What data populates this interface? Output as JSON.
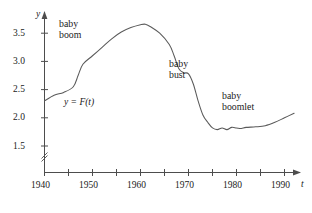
{
  "figure": {
    "background_color": "#ffffff",
    "curve_color": "#5a5a5a",
    "axis_color": "#4d4d4d",
    "text_color": "#1a1a1a"
  },
  "axes": {
    "x_axis_name": "t",
    "y_axis_name": "y",
    "x_tick_labels": [
      "1940",
      "1950",
      "1960",
      "1970",
      "1980",
      "1990"
    ],
    "x_minor_ticks": [
      "1945",
      "1955",
      "1965",
      "1975",
      "1985"
    ],
    "y_tick_labels": [
      "1.5",
      "2.0",
      "2.5",
      "3.0",
      "3.5"
    ],
    "y_axis_break": "axis-break-double-slash"
  },
  "annotations": {
    "baby_boom": {
      "line1": "baby",
      "line2": "boom"
    },
    "baby_bust": {
      "line1": "baby",
      "line2": "bust"
    },
    "baby_boomlet": {
      "line1": "baby",
      "line2": "boomlet"
    },
    "curve_label": "y = F(t)"
  },
  "chart_data": {
    "type": "line",
    "title": "",
    "xlabel": "t",
    "ylabel": "y",
    "xlim": [
      1940,
      1993
    ],
    "ylim": [
      1.28,
      3.78
    ],
    "grid": false,
    "legend": "none",
    "axis_break_y_below": 1.5,
    "x_tick_values": [
      1940,
      1945,
      1950,
      1955,
      1960,
      1965,
      1970,
      1975,
      1980,
      1985,
      1990
    ],
    "x_tick_labeled": [
      1940,
      1950,
      1960,
      1970,
      1980,
      1990
    ],
    "y_tick_values": [
      1.5,
      2.0,
      2.5,
      3.0,
      3.5
    ],
    "series": [
      {
        "name": "y = F(t)",
        "x": [
          1940,
          1942,
          1944,
          1946,
          1947,
          1948,
          1950,
          1952,
          1954,
          1956,
          1958,
          1960,
          1961,
          1962,
          1964,
          1966,
          1967,
          1968,
          1969,
          1970,
          1971,
          1972,
          1973,
          1974,
          1975,
          1976,
          1977,
          1978,
          1979,
          1980,
          1981,
          1982,
          1984,
          1986,
          1988,
          1990,
          1992
        ],
        "y": [
          2.3,
          2.4,
          2.45,
          2.55,
          2.75,
          2.95,
          3.1,
          3.25,
          3.4,
          3.52,
          3.6,
          3.65,
          3.66,
          3.62,
          3.5,
          3.3,
          3.1,
          2.87,
          2.8,
          2.78,
          2.6,
          2.3,
          2.05,
          1.92,
          1.82,
          1.79,
          1.82,
          1.79,
          1.83,
          1.82,
          1.81,
          1.83,
          1.84,
          1.86,
          1.92,
          2.0,
          2.08
        ]
      }
    ]
  }
}
